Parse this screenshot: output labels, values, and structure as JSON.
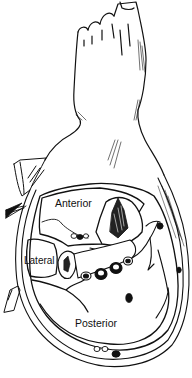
{
  "figure": {
    "labels": {
      "anterior": "Anterior",
      "lateral": "Lateral",
      "posterior": "Posterior"
    },
    "colors": {
      "line": "#111111",
      "background": "#ffffff"
    }
  }
}
